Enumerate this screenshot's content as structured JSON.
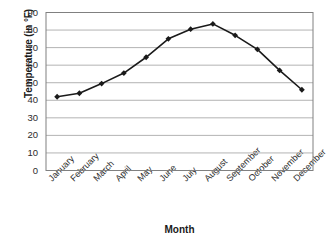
{
  "chart_data": {
    "type": "line",
    "title": "",
    "xlabel": "Month",
    "ylabel": "Temperature (in °F)",
    "categories": [
      "January",
      "February",
      "March",
      "April",
      "May",
      "June",
      "July",
      "August",
      "September",
      "October",
      "November",
      "December"
    ],
    "values": [
      42,
      44,
      49.5,
      55.5,
      64.5,
      75,
      80.5,
      83.5,
      77,
      69,
      57,
      46
    ],
    "series": [
      {
        "name": "Average monthly temperature",
        "values": [
          42,
          44,
          49.5,
          55.5,
          64.5,
          75,
          80.5,
          83.5,
          77,
          69,
          57,
          46
        ]
      }
    ],
    "ylim": [
      0,
      90
    ],
    "ytick_values": [
      0,
      10,
      20,
      30,
      40,
      50,
      60,
      70,
      80,
      90
    ],
    "ytick_labels": [
      "0",
      "10",
      "20",
      "30",
      "40",
      "50",
      "60",
      "70",
      "80",
      "90"
    ],
    "grid": "horizontal",
    "legend": "none",
    "marker": "filled-diamond",
    "line_color": "#1a1a1a",
    "marker_color": "#1a1a1a",
    "grid_color": "#b3b3b3",
    "axis_color": "#808080",
    "background_color": "#ffffff"
  }
}
